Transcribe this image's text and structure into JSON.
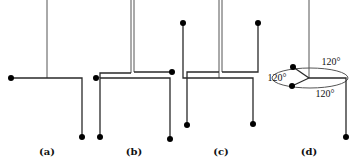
{
  "figure": {
    "panels": [
      {
        "id": "a",
        "label": "(a)",
        "description": "single-legged branched wire structure"
      },
      {
        "id": "b",
        "label": "(b)",
        "description": "double-legged structure with two upper branches"
      },
      {
        "id": "c",
        "label": "(c)",
        "description": "double-legged structure with four branches"
      },
      {
        "id": "d",
        "label": "(d)",
        "description": "three branches in plane separated by angles",
        "angles": [
          "120°",
          "120°",
          "120°"
        ]
      }
    ]
  }
}
